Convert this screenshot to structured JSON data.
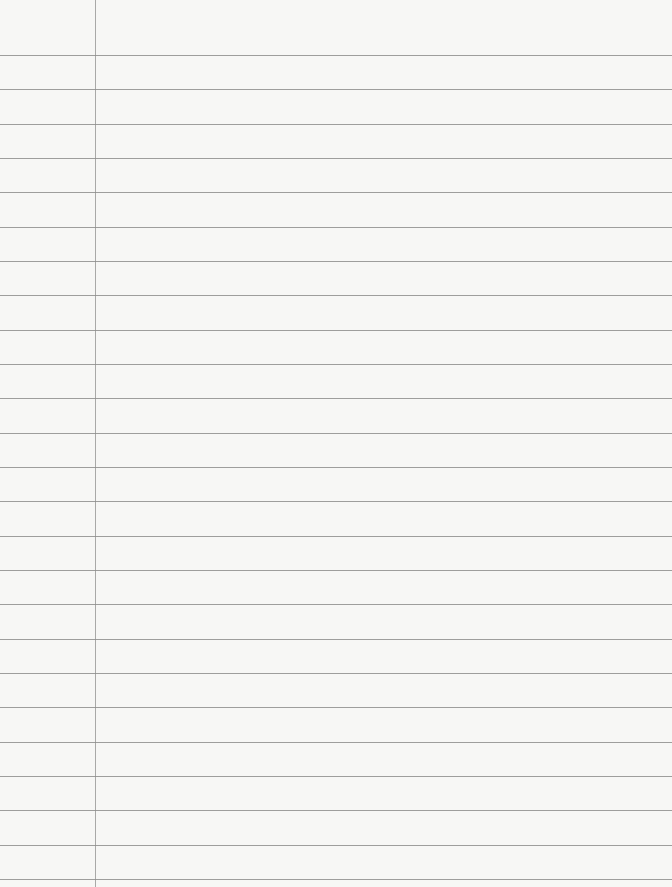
{
  "paper": {
    "type": "lined-paper",
    "background_color": "#f7f7f5",
    "rule_color": "#8e8e8c",
    "margin_color": "#a9a9a7",
    "rules": {
      "count": 25,
      "first_y": 55,
      "spacing": 34.33
    },
    "margin_x": 95
  }
}
